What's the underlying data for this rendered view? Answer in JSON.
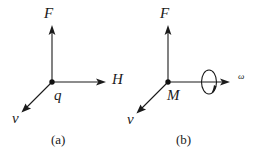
{
  "figure": {
    "background_color": "#ffffff",
    "ink_color": "#1a1a1a",
    "panels": [
      {
        "id": "panel-a",
        "caption": "(a)",
        "origin_label": "q",
        "axes": [
          {
            "name": "F",
            "label": "F",
            "direction": "up"
          },
          {
            "name": "H",
            "label": "H",
            "direction": "right"
          },
          {
            "name": "v",
            "label": "v",
            "direction": "down-left"
          }
        ]
      },
      {
        "id": "panel-b",
        "caption": "(b)",
        "origin_label": "M",
        "rotation_symbol": "spin-loop",
        "axes": [
          {
            "name": "F",
            "label": "F",
            "direction": "up"
          },
          {
            "name": "omega",
            "label": "ω",
            "direction": "right"
          },
          {
            "name": "v",
            "label": "v",
            "direction": "down-left"
          }
        ]
      }
    ]
  },
  "labels": {
    "a_F": "F",
    "a_H": "H",
    "a_q": "q",
    "a_v": "v",
    "a_caption": "(a)",
    "b_F": "F",
    "b_omega": "ω",
    "b_M": "M",
    "b_v": "v",
    "b_caption": "(b)"
  }
}
